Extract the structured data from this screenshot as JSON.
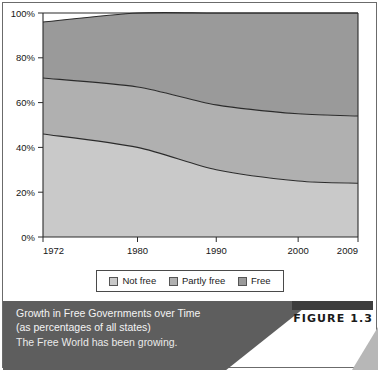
{
  "figure": {
    "tag_label": "FIGURE 1.3",
    "caption_title_line1": "Growth in Free Governments over Time",
    "caption_title_line2": "(as percentages of all states)",
    "caption_subtitle": "The Free World has been growing."
  },
  "legend": {
    "items": [
      {
        "label": "Not free",
        "color": "#c9c9c9"
      },
      {
        "label": "Partly free",
        "color": "#b0b0b0"
      },
      {
        "label": "Free",
        "color": "#9a9a9a"
      }
    ]
  },
  "chart_data": {
    "type": "area",
    "stacked": true,
    "title": "Growth in Free Governments over Time (as percentages of all states)",
    "xlabel": "",
    "ylabel": "",
    "x": [
      1972,
      1980,
      1990,
      2000,
      2009
    ],
    "x_tick_labels": [
      "1972",
      "1980",
      "1990",
      "2000",
      "2009"
    ],
    "x_tick_positions": [
      0,
      0.3,
      0.55,
      0.81,
      1.0
    ],
    "y_tick_labels": [
      "0%",
      "20%",
      "40%",
      "60%",
      "80%",
      "100%"
    ],
    "y_ticks": [
      0,
      20,
      40,
      60,
      80,
      100
    ],
    "ylim": [
      0,
      100
    ],
    "grid": false,
    "legend_position": "bottom",
    "series": [
      {
        "name": "Not free",
        "color": "#c9c9c9",
        "values": [
          46,
          40,
          30,
          25,
          24
        ]
      },
      {
        "name": "Partly free",
        "color": "#b0b0b0",
        "values": [
          25,
          27,
          29,
          30,
          30
        ]
      },
      {
        "name": "Free",
        "color": "#9a9a9a",
        "values": [
          25,
          33,
          41,
          45,
          46
        ]
      }
    ],
    "cumulative_boundaries": {
      "not_free_top": [
        46,
        40,
        30,
        25,
        24
      ],
      "partly_free_top": [
        71,
        67,
        59,
        55,
        54
      ],
      "total_top": [
        96,
        100,
        100,
        100,
        100
      ]
    }
  }
}
